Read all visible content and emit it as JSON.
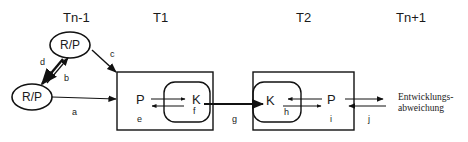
{
  "diagram": {
    "time_labels": {
      "t_n_minus_1": "Tn-1",
      "t1": "T1",
      "t2": "T2",
      "t_n_plus_1": "Tn+1"
    },
    "nodes": {
      "rp_upper": "R/P",
      "rp_lower": "R/P",
      "box1_p": "P",
      "box1_k": "K",
      "box2_k": "K",
      "box2_p": "P"
    },
    "edge_labels": {
      "a": "a",
      "b": "b",
      "c": "c",
      "d": "d",
      "e": "e",
      "f": "f",
      "g": "g",
      "h": "h",
      "i": "i",
      "j": "j"
    },
    "outcome": {
      "line1": "Entwicklungs-",
      "line2": "abweichung"
    }
  }
}
